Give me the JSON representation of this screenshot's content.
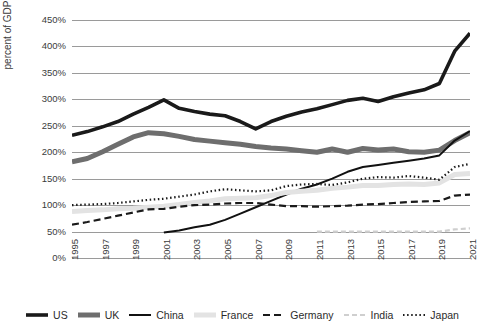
{
  "chart_data": {
    "type": "line",
    "title": "",
    "xlabel": "",
    "ylabel": "percent of GDP",
    "ylim": [
      0,
      450
    ],
    "ytick_labels": [
      "450%",
      "400%",
      "350%",
      "300%",
      "250%",
      "200%",
      "150%",
      "100%",
      "50%",
      "0%"
    ],
    "ytick_values": [
      450,
      400,
      350,
      300,
      250,
      200,
      150,
      100,
      50,
      0
    ],
    "grid": true,
    "legend_position": "bottom",
    "x": [
      1995,
      1996,
      1997,
      1998,
      1999,
      2000,
      2001,
      2002,
      2003,
      2004,
      2005,
      2006,
      2007,
      2008,
      2009,
      2010,
      2011,
      2012,
      2013,
      2014,
      2015,
      2016,
      2017,
      2018,
      2019,
      2020,
      2021
    ],
    "xtick_labels": [
      "1995",
      "1997",
      "1999",
      "2001",
      "2003",
      "2005",
      "2007",
      "2009",
      "2011",
      "2013",
      "2015",
      "2017",
      "2019",
      "2021"
    ],
    "xtick_values": [
      1995,
      1997,
      1999,
      2001,
      2003,
      2005,
      2007,
      2009,
      2011,
      2013,
      2015,
      2017,
      2019,
      2021
    ],
    "series": [
      {
        "name": "US",
        "color": "#1a1a1a",
        "width": 3.6,
        "dash": "none",
        "values": [
          232,
          239,
          248,
          258,
          272,
          285,
          299,
          283,
          277,
          272,
          269,
          258,
          244,
          258,
          268,
          276,
          282,
          290,
          298,
          302,
          296,
          305,
          312,
          318,
          330,
          391,
          425
        ]
      },
      {
        "name": "UK",
        "color": "#6e6e6e",
        "width": 5.0,
        "dash": "none",
        "values": [
          182,
          188,
          201,
          215,
          229,
          237,
          235,
          230,
          224,
          221,
          218,
          215,
          211,
          208,
          206,
          203,
          200,
          206,
          200,
          207,
          204,
          206,
          201,
          200,
          204,
          222,
          237
        ]
      },
      {
        "name": "China",
        "color": "#111111",
        "width": 2.0,
        "dash": "none",
        "start_year": 2001,
        "values": [
          null,
          null,
          null,
          null,
          null,
          null,
          48,
          52,
          58,
          63,
          72,
          84,
          96,
          108,
          120,
          131,
          139,
          150,
          163,
          172,
          176,
          180,
          184,
          188,
          194,
          222,
          240
        ]
      },
      {
        "name": "France",
        "color": "#e3e3e3",
        "width": 5.0,
        "dash": "none",
        "values": [
          88,
          90,
          91,
          93,
          94,
          96,
          98,
          101,
          105,
          108,
          112,
          113,
          114,
          118,
          124,
          126,
          128,
          132,
          134,
          137,
          137,
          139,
          140,
          139,
          142,
          158,
          160
        ]
      },
      {
        "name": "Germany",
        "color": "#1a1a1a",
        "width": 2.2,
        "dash": "7,4",
        "values": [
          63,
          68,
          74,
          80,
          86,
          92,
          93,
          97,
          100,
          101,
          103,
          104,
          104,
          101,
          98,
          98,
          97,
          98,
          99,
          101,
          102,
          104,
          106,
          107,
          108,
          118,
          120
        ]
      },
      {
        "name": "India",
        "color": "#cfcfcf",
        "width": 2.2,
        "dash": "5,3",
        "start_year": 2011,
        "values": [
          null,
          null,
          null,
          null,
          null,
          null,
          null,
          null,
          null,
          null,
          null,
          null,
          null,
          null,
          null,
          null,
          50,
          50,
          50,
          50,
          50,
          50,
          50,
          50,
          50,
          54,
          56
        ]
      },
      {
        "name": "Japan",
        "color": "#1a1a1a",
        "width": 2.2,
        "dash": "1.5,2.6",
        "values": [
          100,
          101,
          102,
          104,
          107,
          110,
          112,
          116,
          120,
          126,
          130,
          128,
          126,
          128,
          136,
          139,
          140,
          138,
          143,
          150,
          153,
          152,
          155,
          152,
          148,
          172,
          178
        ]
      }
    ]
  },
  "legend": {
    "items": [
      {
        "label": "US"
      },
      {
        "label": "UK"
      },
      {
        "label": "China"
      },
      {
        "label": "France"
      },
      {
        "label": "Germany"
      },
      {
        "label": "India"
      },
      {
        "label": "Japan"
      }
    ]
  }
}
